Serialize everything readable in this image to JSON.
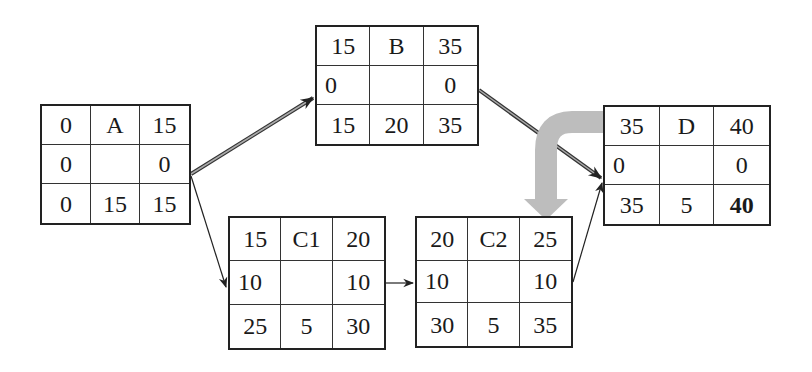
{
  "diagram": {
    "type": "activity-on-node network",
    "nodes": [
      {
        "id": "A",
        "es": "0",
        "name": "A",
        "ef": "15",
        "slack_left": "0",
        "slack_right": "0",
        "ls": "0",
        "duration": "15",
        "lf": "15"
      },
      {
        "id": "B",
        "es": "15",
        "name": "B",
        "ef": "35",
        "slack_left": "0",
        "slack_right": "0",
        "ls": "15",
        "duration": "20",
        "lf": "35"
      },
      {
        "id": "C1",
        "es": "15",
        "name": "C1",
        "ef": "20",
        "slack_left": "10",
        "slack_right": "10",
        "ls": "25",
        "duration": "5",
        "lf": "30"
      },
      {
        "id": "C2",
        "es": "20",
        "name": "C2",
        "ef": "25",
        "slack_left": "10",
        "slack_right": "10",
        "ls": "30",
        "duration": "5",
        "lf": "35"
      },
      {
        "id": "D",
        "es": "35",
        "name": "D",
        "ef": "40",
        "slack_left": "0",
        "slack_right": "0",
        "ls": "35",
        "duration": "5",
        "lf": "40"
      }
    ],
    "edges": [
      {
        "from": "A",
        "to": "B",
        "critical": true
      },
      {
        "from": "A",
        "to": "C1",
        "critical": false
      },
      {
        "from": "B",
        "to": "D",
        "critical": true
      },
      {
        "from": "C1",
        "to": "C2",
        "critical": false
      },
      {
        "from": "C2",
        "to": "D",
        "critical": false
      }
    ],
    "annotation": {
      "shape": "curved grey arrow",
      "from": "D",
      "to": "C2",
      "color": "#b8b8b8"
    },
    "colors": {
      "line": "#222222",
      "critical_line": "#555555",
      "annotation_arrow": "#b8b8b8"
    }
  }
}
